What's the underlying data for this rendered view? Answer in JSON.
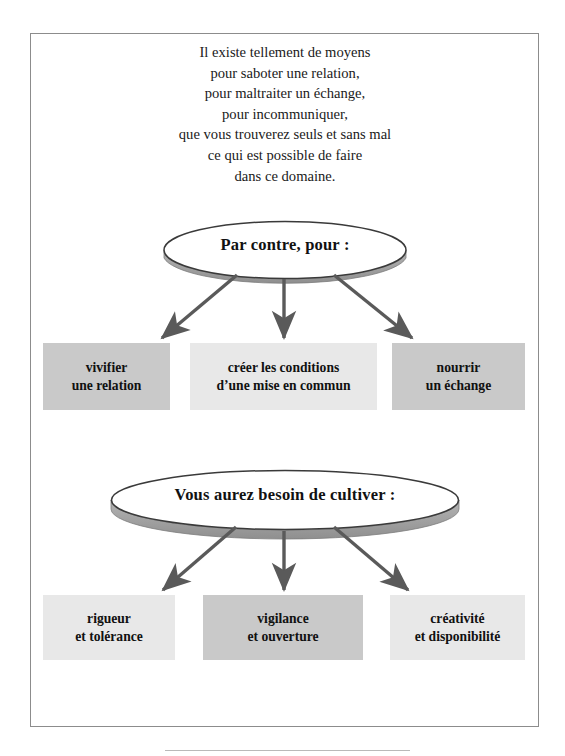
{
  "page": {
    "intro_text": "Il existe tellement de moyens\npour saboter une relation,\npour maltraiter un échange,\npour incommuniquer,\nque vous trouverez seuls et sans mal\nce qui est possible de faire\ndans ce domaine."
  },
  "colors": {
    "frame_border": "#8c8c8c",
    "ellipse_fill": "#ffffff",
    "ellipse_stroke": "#3a3a3a",
    "ellipse_shadow": "#9a9a9a",
    "arrow": "#5a5a5a",
    "box_dark": "#c9c9c9",
    "box_light": "#e8e8e8",
    "text": "#111111",
    "bottom_rule": "#b9b9b9"
  },
  "sections": [
    {
      "id": "section-1",
      "ellipse_label": "Par contre, pour :",
      "boxes": [
        {
          "id": "box-r1-c1",
          "text": "vivifier\nune relation",
          "shade": "dark"
        },
        {
          "id": "box-r1-c2",
          "text": "créer les conditions\nd’une mise en commun",
          "shade": "light"
        },
        {
          "id": "box-r1-c3",
          "text": "nourrir\nun échange",
          "shade": "dark"
        }
      ]
    },
    {
      "id": "section-2",
      "ellipse_label": "Vous aurez besoin de cultiver :",
      "boxes": [
        {
          "id": "box-r2-c1",
          "text": "rigueur\net tolérance",
          "shade": "light"
        },
        {
          "id": "box-r2-c2",
          "text": "vigilance\net ouverture",
          "shade": "dark"
        },
        {
          "id": "box-r2-c3",
          "text": "créativité\net disponibilité",
          "shade": "light"
        }
      ]
    }
  ]
}
